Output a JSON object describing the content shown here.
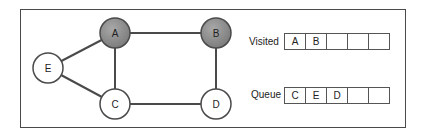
{
  "graph": {
    "nodes": [
      {
        "id": "A",
        "x": 115,
        "y": 33,
        "visited": true
      },
      {
        "id": "B",
        "x": 216,
        "y": 33,
        "visited": true
      },
      {
        "id": "E",
        "x": 48,
        "y": 68,
        "visited": false
      },
      {
        "id": "C",
        "x": 115,
        "y": 104,
        "visited": false
      },
      {
        "id": "D",
        "x": 216,
        "y": 104,
        "visited": false
      }
    ],
    "edges": [
      [
        "A",
        "B"
      ],
      [
        "A",
        "E"
      ],
      [
        "A",
        "C"
      ],
      [
        "B",
        "D"
      ],
      [
        "E",
        "C"
      ],
      [
        "C",
        "D"
      ]
    ],
    "colors": {
      "visited_fill": "#8a8a8a",
      "unvisited_fill": "#ffffff",
      "stroke": "#4a4a4a"
    }
  },
  "visited": {
    "label": "Visited",
    "cells": [
      "A",
      "B",
      "",
      "",
      ""
    ]
  },
  "queue": {
    "label": "Queue",
    "cells": [
      "C",
      "E",
      "D",
      "",
      ""
    ]
  }
}
